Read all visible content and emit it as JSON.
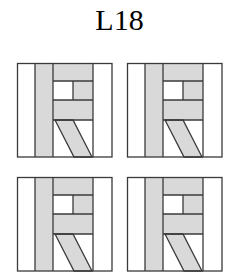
{
  "title": "L18",
  "colors": {
    "stroke": "#3a3a3a",
    "fill": "#d9d9d9",
    "background": "#ffffff"
  },
  "panels": [
    {
      "id": 1,
      "position": "top-left",
      "x": 17,
      "y": 63,
      "variant": "plain"
    },
    {
      "id": 2,
      "position": "top-right",
      "x": 127,
      "y": 63,
      "variant": "plain"
    },
    {
      "id": 3,
      "position": "bottom-left",
      "x": 17,
      "y": 177,
      "variant": "plain"
    },
    {
      "id": 4,
      "position": "bottom-right",
      "x": 127,
      "y": 177,
      "variant": "plain"
    }
  ]
}
